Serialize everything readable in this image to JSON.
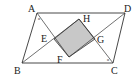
{
  "diagram": {
    "type": "geometry",
    "colors": {
      "stroke": "#333333",
      "shade": "#c8c8c8",
      "background": "#ffffff"
    },
    "vertices": {
      "A": {
        "label": "A",
        "x": 37,
        "y": 13
      },
      "B": {
        "label": "B",
        "x": 22,
        "y": 63
      },
      "C": {
        "label": "C",
        "x": 113,
        "y": 63
      },
      "D": {
        "label": "D",
        "x": 125,
        "y": 13
      }
    },
    "inner": {
      "E": {
        "label": "E",
        "x": 54,
        "y": 39
      },
      "F": {
        "label": "F",
        "x": 69,
        "y": 57
      },
      "G": {
        "label": "G",
        "x": 95,
        "y": 39
      },
      "H": {
        "label": "H",
        "x": 79,
        "y": 19
      }
    },
    "angle_marks": {
      "A": "α",
      "C": "α"
    }
  }
}
